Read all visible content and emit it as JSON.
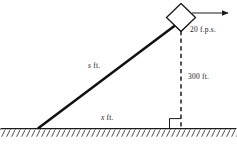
{
  "figure": {
    "type": "related-rates-kite-diagram",
    "background_color": "#ffffff",
    "ink_color": "#1a1a1a",
    "labels": {
      "string_length": {
        "symbol": "s",
        "unit": "ft.",
        "full": "s ft."
      },
      "base_distance": {
        "symbol": "x",
        "unit": "ft.",
        "full": "x ft."
      },
      "height": {
        "value": "300",
        "unit": "ft.",
        "full": "300 ft."
      },
      "velocity": {
        "value": "20",
        "unit": "f.p.s.",
        "full": "20 f.p.s."
      }
    },
    "elements": {
      "kite": "kite-diamond",
      "string": "string-line",
      "altitude": "dashed-altitude-line",
      "ground": "ground-line",
      "hatching": "ground-hatching",
      "right_angle": "right-angle-marker",
      "velocity_arrow": "velocity-arrow"
    },
    "geometry": {
      "ground_y": 128,
      "anchor_x": 38,
      "kite_x": 181,
      "kite_y": 18,
      "arrow_start_x": 192,
      "arrow_end_x": 232,
      "arrow_y": 13
    }
  }
}
